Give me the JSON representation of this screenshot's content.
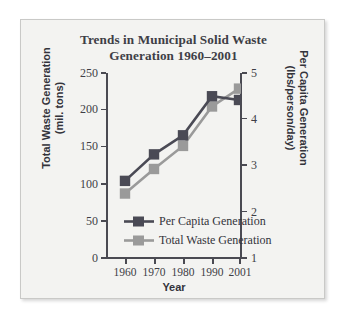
{
  "chart_data": {
    "type": "line",
    "title": "Trends in Municipal Solid Waste Generation 1960–2001",
    "title_line1": "Trends in Municipal Solid Waste",
    "title_line2": "Generation 1960–2001",
    "xlabel": "Year",
    "categories": [
      "1960",
      "1970",
      "1980",
      "1990",
      "2001"
    ],
    "x_tick_labels": [
      "1960",
      "1970",
      "1980",
      "1990",
      "2001"
    ],
    "grid": false,
    "legend_position": "lower-center-inside",
    "axes": {
      "left": {
        "label": "Total Waste Generation (mil. tons)",
        "label_line1": "Total Waste Generation",
        "label_line2": "(mil. tons)",
        "ylim": [
          0,
          250
        ],
        "ticks": [
          0,
          50,
          100,
          150,
          200,
          250
        ],
        "tick_labels": [
          "0",
          "50",
          "100",
          "150",
          "200",
          "250"
        ]
      },
      "right": {
        "label": "Per Capita Generation (lbs/person/day)",
        "label_line1": "Per Capita Generation",
        "label_line2": "(lbs/person/day)",
        "ylim": [
          1,
          5
        ],
        "ticks": [
          1,
          2,
          3,
          4,
          5
        ],
        "tick_labels": [
          "1",
          "2",
          "3",
          "4",
          "5"
        ]
      }
    },
    "series": [
      {
        "name": "Per Capita Generation",
        "axis": "right",
        "unit": "lbs/person/day",
        "color": "#4a4a55",
        "marker": "square",
        "values": [
          2.68,
          3.25,
          3.66,
          4.5,
          4.42
        ]
      },
      {
        "name": "Total Waste Generation",
        "axis": "left",
        "unit": "mil. tons",
        "color": "#9a9a9a",
        "marker": "square",
        "values": [
          88,
          121,
          152,
          205,
          229
        ]
      }
    ],
    "colors": {
      "per_capita": "#4a4a55",
      "total_waste": "#9a9a9a",
      "axis": "#4a4a52",
      "text": "#33333b",
      "plot_background": "#f3f3f1",
      "frame_border": "#c9c9c7"
    }
  },
  "legend": {
    "items": [
      {
        "label": "Per Capita Generation",
        "color": "#4a4a55"
      },
      {
        "label": "Total Waste Generation",
        "color": "#9a9a9a"
      }
    ]
  }
}
